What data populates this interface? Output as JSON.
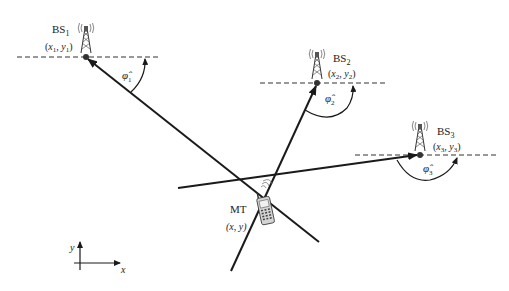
{
  "diagram": {
    "title": "",
    "colors": {
      "line": "#1a1a1a",
      "dash": "#333333",
      "phone": "#cfcfcf"
    },
    "base_stations": [
      {
        "id": "BS1",
        "name": "BS",
        "sub": "1",
        "coord_x": "x",
        "coord_y": "y",
        "coord_sub": "1",
        "angle_symbol": "φ̂",
        "angle_sub": "1"
      },
      {
        "id": "BS2",
        "name": "BS",
        "sub": "2",
        "coord_x": "x",
        "coord_y": "y",
        "coord_sub": "2",
        "angle_symbol": "φ̂",
        "angle_sub": "2"
      },
      {
        "id": "BS3",
        "name": "BS",
        "sub": "3",
        "coord_x": "x",
        "coord_y": "y",
        "coord_sub": "3",
        "angle_symbol": "φ̂",
        "angle_sub": "3"
      }
    ],
    "mobile": {
      "name": "MT",
      "coords": "(x, y)"
    },
    "axes": {
      "x_label": "x",
      "y_label": "y"
    }
  }
}
